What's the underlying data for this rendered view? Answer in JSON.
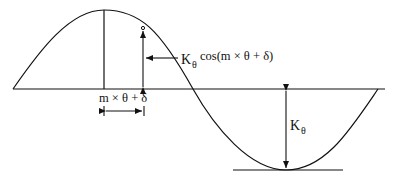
{
  "diagram": {
    "labels": {
      "amplitude_term": "K",
      "amplitude_sub": "θ",
      "cos_term": "cos(m × θ + δ)",
      "phase_label": "m × θ + δ",
      "depth_k": "K",
      "depth_sub": "θ"
    },
    "colors": {
      "stroke": "#111111",
      "background": "#ffffff"
    }
  }
}
